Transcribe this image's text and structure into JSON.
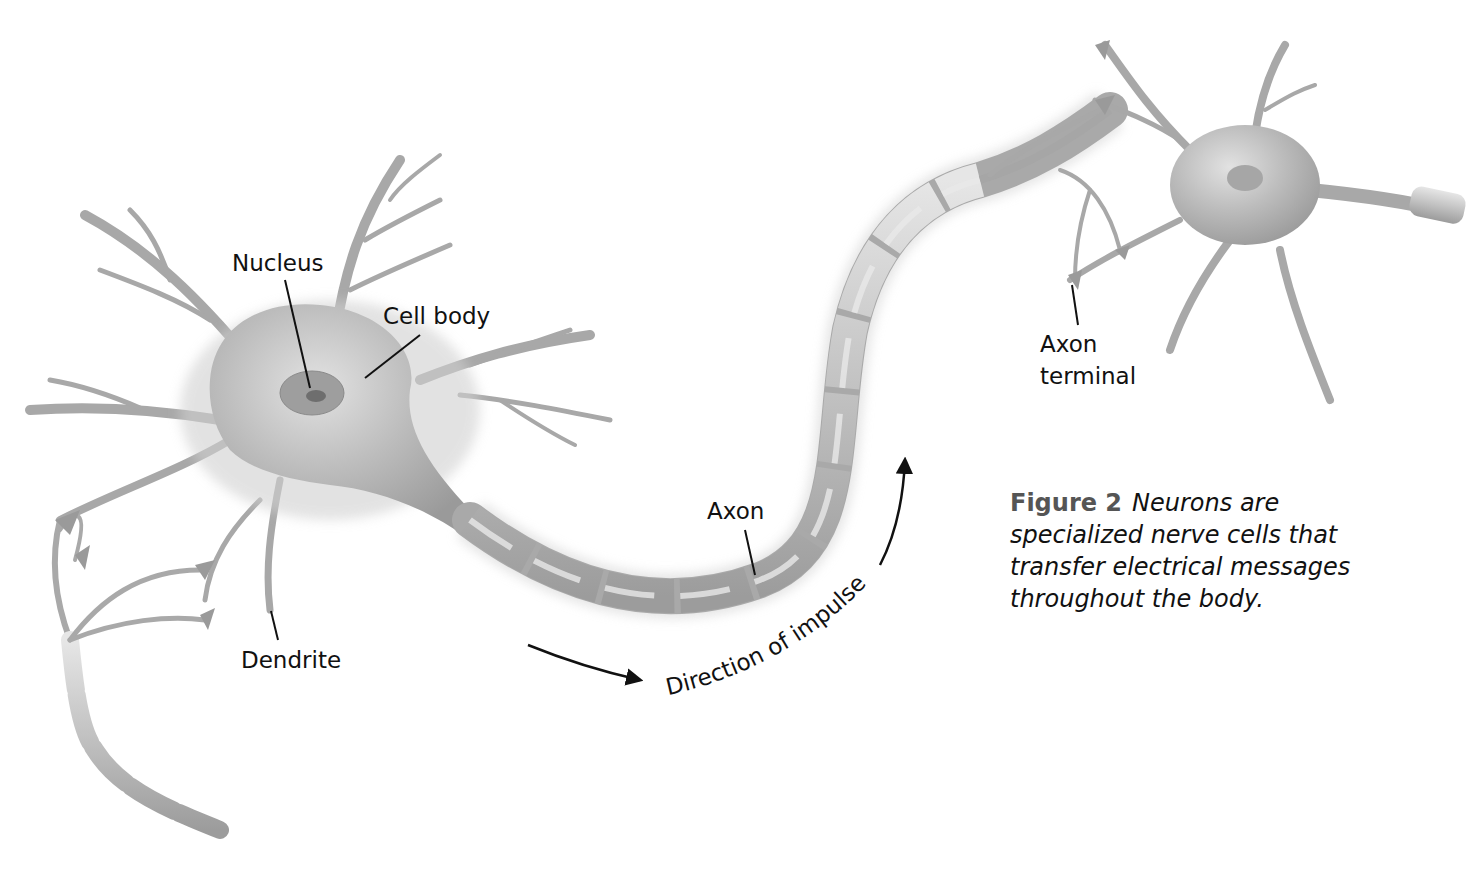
{
  "labels": {
    "nucleus": "Nucleus",
    "cell_body": "Cell body",
    "dendrite": "Dendrite",
    "axon": "Axon",
    "axon_terminal_line1": "Axon",
    "axon_terminal_line2": "terminal",
    "direction": "Direction of impulse"
  },
  "caption": {
    "figure_label": "Figure 2",
    "text": "Neurons are specialized nerve cells that transfer electrical messages throughout the body."
  },
  "colors": {
    "cell_fill": "#b9b9b9",
    "cell_shadow": "#8f8f8f",
    "myelin": "#c4c4c4",
    "text": "#111111",
    "figure_label": "#555555"
  }
}
